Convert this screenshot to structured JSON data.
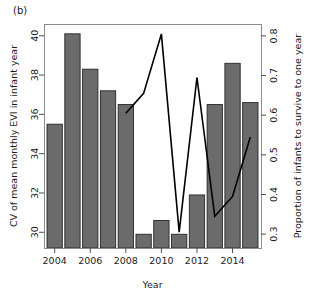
{
  "figure": {
    "panel_label": "(b)",
    "background": "#ffffff",
    "frame_color": "#8c8c8c",
    "bar_fill": "#6b6b6b",
    "bar_stroke": "#262626",
    "line_color": "#000000"
  },
  "chart_data": {
    "type": "bar",
    "title": "",
    "subtitle": "",
    "panel": "(b)",
    "xlabel": "Year",
    "ylabel": "CV of mean monthly EVI in infant year",
    "y2label": "Proportion of infants to survive to one year",
    "grid": false,
    "legend": "none",
    "xlim": [
      2003.4,
      2015.6
    ],
    "ylim": [
      29.2,
      40.6
    ],
    "y2lim": [
      0.265,
      0.83
    ],
    "xticks": [
      2004,
      2006,
      2008,
      2010,
      2012,
      2014
    ],
    "xtick_labels": [
      "2004",
      "2006",
      "2008",
      "2010",
      "2012",
      "2014"
    ],
    "yticks": [
      30,
      32,
      34,
      36,
      38,
      40
    ],
    "ytick_labels": [
      "30",
      "32",
      "34",
      "36",
      "38",
      "40"
    ],
    "y2ticks": [
      0.3,
      0.4,
      0.5,
      0.6,
      0.7,
      0.8
    ],
    "y2tick_labels": [
      "0.3",
      "0.4",
      "0.5",
      "0.6",
      "0.7",
      "0.8"
    ],
    "categories": [
      2004,
      2005,
      2006,
      2007,
      2008,
      2009,
      2010,
      2011,
      2012,
      2013,
      2014,
      2015
    ],
    "series": [
      {
        "name": "CV of mean monthly EVI in infant year",
        "type": "bar",
        "axis": "left",
        "values": [
          35.5,
          40.1,
          38.3,
          37.2,
          36.5,
          29.9,
          30.6,
          29.9,
          31.9,
          36.5,
          38.6,
          36.6
        ]
      },
      {
        "name": "Proportion of infants to survive to one year",
        "type": "line",
        "axis": "right",
        "x": [
          2008,
          2009,
          2010,
          2011,
          2012,
          2013,
          2014,
          2015
        ],
        "values": [
          0.605,
          0.655,
          0.805,
          0.305,
          0.695,
          0.345,
          0.395,
          0.545
        ]
      }
    ]
  }
}
